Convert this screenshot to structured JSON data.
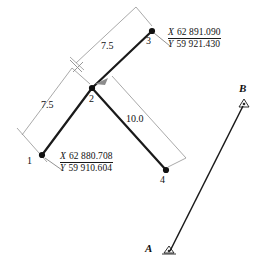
{
  "figure": {
    "type": "survey-traverse-diagram",
    "width": 266,
    "height": 275,
    "background": "#ffffff",
    "line_color": "#1a1a1a",
    "dim_color": "#888888"
  },
  "points": [
    {
      "id": "1",
      "label": "1",
      "x": 42,
      "y": 155,
      "marker": "filled-dot"
    },
    {
      "id": "2",
      "label": "2",
      "x": 92,
      "y": 88,
      "marker": "filled-dot"
    },
    {
      "id": "3",
      "label": "3",
      "x": 152,
      "y": 31,
      "marker": "filled-dot"
    },
    {
      "id": "4",
      "label": "4",
      "x": 166,
      "y": 170,
      "marker": "filled-dot"
    }
  ],
  "stations": [
    {
      "id": "A",
      "label": "A",
      "x": 169,
      "y": 252,
      "marker": "triangle-station"
    },
    {
      "id": "B",
      "label": "B",
      "x": 244,
      "y": 104,
      "marker": "triangle-station"
    }
  ],
  "segments": [
    {
      "from": "1",
      "to": "2"
    },
    {
      "from": "2",
      "to": "3"
    },
    {
      "from": "2",
      "to": "4"
    },
    {
      "from": "A",
      "to": "B"
    }
  ],
  "dimensions": [
    {
      "id": "dim-1-2",
      "value": "7.5",
      "from": "1",
      "to": "2"
    },
    {
      "id": "dim-2-3",
      "value": "7.5",
      "from": "2",
      "to": "3"
    },
    {
      "id": "dim-2-4",
      "value": "10.0",
      "from": "2",
      "to": "4"
    }
  ],
  "coordinate_labels": [
    {
      "id": "coords-point-3",
      "point": "3",
      "x_axis": "X",
      "x_value": "62 891.090",
      "y_axis": "Y",
      "y_value": "59 921.430"
    },
    {
      "id": "coords-point-1",
      "point": "1",
      "x_axis": "X",
      "x_value": "62 880.708",
      "y_axis": "Y",
      "y_value": "59 910.604"
    }
  ]
}
